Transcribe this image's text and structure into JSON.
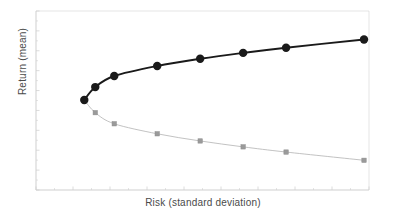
{
  "chart_data": {
    "type": "line",
    "title": "",
    "subtitle": "",
    "xlabel": "Risk (standard deviation)",
    "ylabel": "Return (mean)",
    "grid": false,
    "legend": "none",
    "axis_tick_labels": {
      "x": [],
      "y": []
    },
    "xlim": [
      0,
      1
    ],
    "ylim": [
      0,
      1
    ],
    "annotations": [],
    "series": [
      {
        "name": "Efficient frontier (upper branch)",
        "color": "#1a1a1a",
        "line_width": 1.9,
        "marker": "circle",
        "marker_size": 4.2,
        "x": [
          0.145,
          0.178,
          0.235,
          0.364,
          0.493,
          0.622,
          0.751,
          0.985
        ],
        "y": [
          0.503,
          0.575,
          0.637,
          0.693,
          0.733,
          0.766,
          0.795,
          0.841
        ]
      },
      {
        "name": "Inefficient frontier (lower branch)",
        "color": "#b3b3b3",
        "line_width": 0.8,
        "marker": "square",
        "marker_size": 2.2,
        "x": [
          0.145,
          0.178,
          0.235,
          0.364,
          0.493,
          0.622,
          0.751,
          0.985
        ],
        "y": [
          0.503,
          0.432,
          0.37,
          0.314,
          0.274,
          0.241,
          0.212,
          0.166
        ]
      }
    ],
    "vertex": {
      "x": 0.145,
      "y": 0.503,
      "label": "minimum variance point"
    }
  },
  "frame": {
    "color": "#cfcfcf",
    "left": 36,
    "top": 11,
    "right": 369,
    "bottom": 190
  },
  "ticks": {
    "color": "#d8d8d8",
    "x_major_count": 9,
    "x_minor_per_major": 1,
    "y_major_count": 9,
    "y_minor_per_major": 1
  }
}
